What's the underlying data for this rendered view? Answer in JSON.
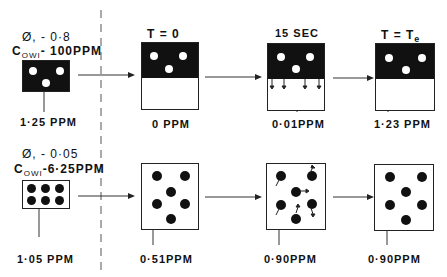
{
  "top_row": {
    "initial": {
      "phi_label": "Ø, - 0·8",
      "cowi_prefix": "C",
      "cowi_sub": "OWI",
      "cowi_value": "- 100PPM",
      "concentration": "1·25 PPM"
    },
    "stages": [
      {
        "title": "T = 0",
        "concentration": "0 PPM"
      },
      {
        "title": "15 SEC",
        "concentration": "0·01PPM"
      },
      {
        "title": "T = T",
        "title_sub": "e",
        "concentration": "1·23 PPM"
      }
    ]
  },
  "bottom_row": {
    "initial": {
      "phi_label": "Ø, - 0·05",
      "cowi_prefix": "C",
      "cowi_sub": "OWI",
      "cowi_value": "-6·25PPM",
      "concentration": "1·05 PPM"
    },
    "stages": [
      {
        "concentration": "0·51PPM"
      },
      {
        "concentration": "0·90PPM"
      },
      {
        "concentration": "0·90PPM"
      }
    ]
  },
  "colors": {
    "ink": "#111111",
    "background": "#ffffff"
  }
}
